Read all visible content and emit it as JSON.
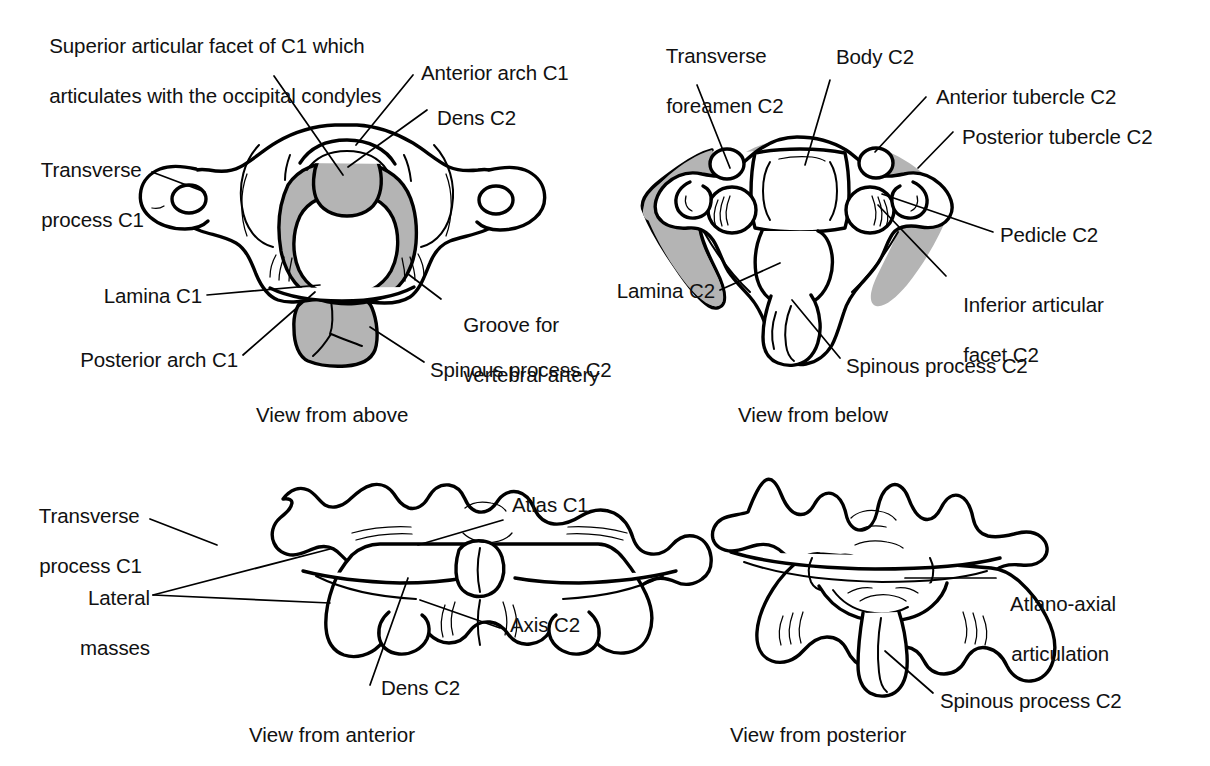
{
  "figure": {
    "colors": {
      "ink": "#000000",
      "shading_gray": "#b4b4b4",
      "background": "#ffffff"
    }
  },
  "panels": [
    {
      "id": "view-above",
      "caption": "View from above",
      "labels": [
        {
          "key": "superior-articular-facet",
          "text": "Superior articular facet of C1 which\narticulates with the occipital condyles"
        },
        {
          "key": "anterior-arch-c1",
          "text": "Anterior arch C1"
        },
        {
          "key": "dens-c2",
          "text": "Dens C2"
        },
        {
          "key": "transverse-process-c1",
          "text": "Transverse\nprocess C1"
        },
        {
          "key": "lamina-c1",
          "text": "Lamina C1"
        },
        {
          "key": "posterior-arch-c1",
          "text": "Posterior arch C1"
        },
        {
          "key": "groove-vertebral-artery",
          "text": "Groove for\nvertebral artery"
        },
        {
          "key": "spinous-process-c2",
          "text": "Spinous process C2"
        }
      ]
    },
    {
      "id": "view-below",
      "caption": "View from below",
      "labels": [
        {
          "key": "transverse-foreamen-c2",
          "text": "Transverse\nforeamen C2"
        },
        {
          "key": "body-c2",
          "text": "Body C2"
        },
        {
          "key": "anterior-tubercle-c2",
          "text": "Anterior tubercle C2"
        },
        {
          "key": "posterior-tubercle-c2",
          "text": "Posterior tubercle C2"
        },
        {
          "key": "pedicle-c2",
          "text": "Pedicle C2"
        },
        {
          "key": "inferior-articular-facet-c2",
          "text": "Inferior articular\nfacet C2"
        },
        {
          "key": "lamina-c2",
          "text": "Lamina C2"
        },
        {
          "key": "spinous-process-c2",
          "text": "Spinous process C2"
        }
      ]
    },
    {
      "id": "view-anterior",
      "caption": "View from anterior",
      "labels": [
        {
          "key": "transverse-process-c1",
          "text": "Transverse\nprocess C1"
        },
        {
          "key": "lateral-masses",
          "text": "Lateral\nmasses"
        },
        {
          "key": "atlas-c1",
          "text": "Atlas C1"
        },
        {
          "key": "axis-c2",
          "text": "Axis C2"
        },
        {
          "key": "dens-c2",
          "text": "Dens C2"
        }
      ]
    },
    {
      "id": "view-posterior",
      "caption": "View from posterior",
      "labels": [
        {
          "key": "atlano-axial-articulation",
          "text": "Atlano-axial\narticulation"
        },
        {
          "key": "spinous-process-c2",
          "text": "Spinous process C2"
        }
      ]
    }
  ],
  "text": {
    "p1_superior_facet_l1": "Superior articular facet of C1 which",
    "p1_superior_facet_l2": "articulates with the occipital condyles",
    "p1_anterior_arch": "Anterior arch C1",
    "p1_dens": "Dens C2",
    "p1_transverse_l1": "Transverse",
    "p1_transverse_l2": "process C1",
    "p1_lamina": "Lamina C1",
    "p1_posterior_arch": "Posterior arch C1",
    "p1_groove_l1": "Groove for",
    "p1_groove_l2": "vertebral artery",
    "p1_spinous": "Spinous process C2",
    "p1_caption": "View from above",
    "p2_transverse_l1": "Transverse",
    "p2_transverse_l2": "foreamen C2",
    "p2_body": "Body C2",
    "p2_ant_tubercle": "Anterior tubercle C2",
    "p2_post_tubercle": "Posterior tubercle C2",
    "p2_pedicle": "Pedicle C2",
    "p2_inf_facet_l1": "Inferior articular",
    "p2_inf_facet_l2": "facet C2",
    "p2_lamina": "Lamina C2",
    "p2_spinous": "Spinous process C2",
    "p2_caption": "View from below",
    "p3_transverse_l1": "Transverse",
    "p3_transverse_l2": "process C1",
    "p3_lateral_l1": "Lateral",
    "p3_lateral_l2": "masses",
    "p3_atlas": "Atlas C1",
    "p3_axis": "Axis C2",
    "p3_dens": "Dens C2",
    "p3_caption": "View from anterior",
    "p4_atlanto_l1": "Atlano-axial",
    "p4_atlanto_l2": "articulation",
    "p4_spinous": "Spinous process C2",
    "p4_caption": "View from posterior"
  }
}
